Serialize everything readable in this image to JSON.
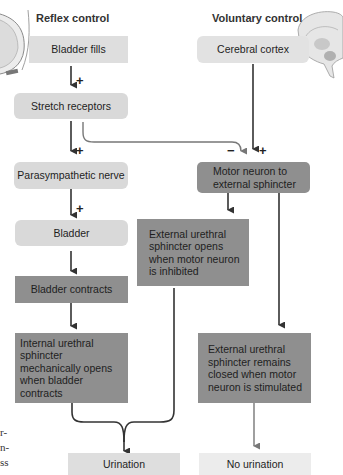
{
  "headings": {
    "reflex": "Reflex control",
    "voluntary": "Voluntary control"
  },
  "illustrations": {
    "left": "bladder-illustration",
    "right": "brain-illustration"
  },
  "reflex_path": {
    "bladder_fills": "Bladder fills",
    "stretch_receptors": "Stretch receptors",
    "parasympathetic_nerve": "Parasympathetic nerve",
    "bladder": "Bladder",
    "bladder_contracts": "Bladder contracts",
    "internal_sphincter": "Internal urethral sphincter mechanically opens when bladder contracts"
  },
  "voluntary_path": {
    "cerebral_cortex": "Cerebral cortex",
    "motor_neuron": "Motor neuron to external sphincter",
    "external_opens": "External urethral sphincter opens when motor neuron is inhibited",
    "external_closed": "External urethral sphincter remains closed when motor neuron is stimulated"
  },
  "outcomes": {
    "urination": "Urination",
    "no_urination": "No urination"
  },
  "signs": {
    "plus_1": "+",
    "plus_2": "+",
    "plus_3": "+",
    "minus": "−",
    "plus_4": "+"
  },
  "margin_fragments": [
    "r-",
    "n-",
    "ss"
  ],
  "colors": {
    "light_box": "#d9d9d9",
    "dark_box": "#8f8f8f",
    "arrow": "#333333",
    "grey_arrow": "#777777"
  }
}
